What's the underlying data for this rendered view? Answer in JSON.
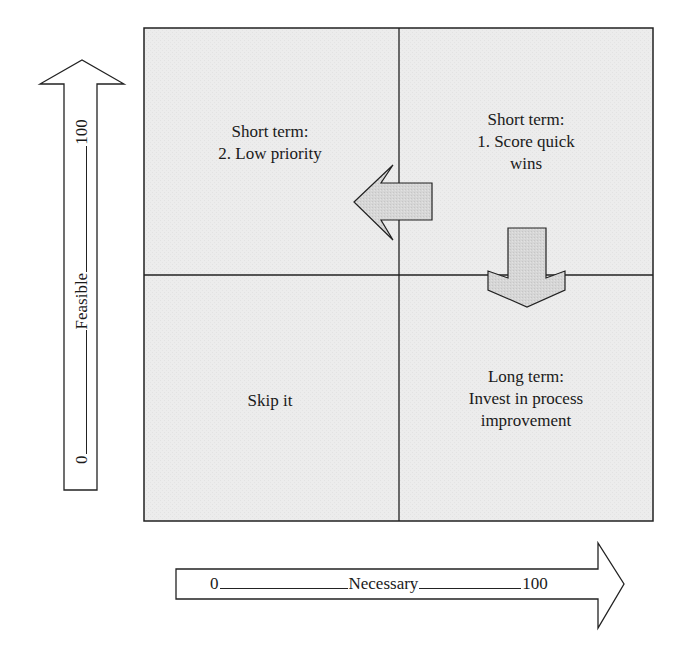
{
  "diagram": {
    "type": "2x2 priority matrix",
    "quadrants": {
      "top_left": {
        "line1": "Short term:",
        "line2": "2. Low priority"
      },
      "top_right": {
        "line1": "Short term:",
        "line2": "1. Score quick",
        "line3": "wins"
      },
      "bottom_left": {
        "line1": "Skip it"
      },
      "bottom_right": {
        "line1": "Long term:",
        "line2": "Invest in process",
        "line3": "improvement"
      }
    },
    "y_axis": {
      "label": "Feasible",
      "min": "0",
      "max": "100",
      "text": "0 ________ Feasible ________ 100"
    },
    "x_axis": {
      "label": "Necessary",
      "min": "0",
      "max": "100",
      "text": "0_______________Necessary____________100"
    },
    "colors": {
      "quadrant_fill": "#ededed",
      "arrow_fill": "#d4d4d4",
      "stroke": "#222222"
    }
  }
}
